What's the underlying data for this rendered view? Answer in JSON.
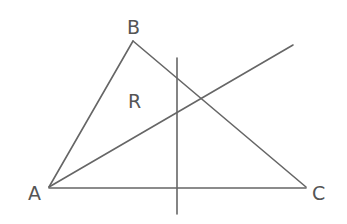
{
  "diagram": {
    "type": "geometry",
    "background": "#ffffff",
    "stroke_color": "#666666",
    "text_color": "#555555",
    "points": {
      "A": {
        "label": "A",
        "x": 49,
        "y": 187
      },
      "B": {
        "label": "B",
        "x": 133,
        "y": 41
      },
      "C": {
        "label": "C",
        "x": 306,
        "y": 187
      }
    },
    "region_label": {
      "label": "R",
      "x": 133,
      "y": 100
    },
    "lines": [
      {
        "name": "side-AB",
        "from": "A",
        "to": "B"
      },
      {
        "name": "side-BC",
        "from": "B",
        "to": "C"
      },
      {
        "name": "side-AC",
        "from": "A",
        "to": "C"
      },
      {
        "name": "ray-from-A",
        "x1": 49,
        "y1": 187,
        "x2": 293,
        "y2": 45
      },
      {
        "name": "vertical-line",
        "x1": 177,
        "y1": 58,
        "x2": 177,
        "y2": 214
      }
    ]
  }
}
